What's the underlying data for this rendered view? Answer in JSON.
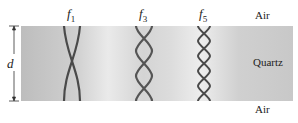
{
  "diagram": {
    "dimension_label": "d",
    "modes": [
      {
        "label": "f",
        "subscript": "1",
        "half_wavelengths": 1
      },
      {
        "label": "f",
        "subscript": "3",
        "half_wavelengths": 3
      },
      {
        "label": "f",
        "subscript": "5",
        "half_wavelengths": 5
      }
    ],
    "media": {
      "top": "Air",
      "middle": "Quartz",
      "bottom": "Air"
    },
    "colors": {
      "slab": "#d2d2d2",
      "wave": "#4a4a4a",
      "text": "#222222"
    }
  }
}
